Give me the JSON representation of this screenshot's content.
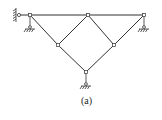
{
  "figure": {
    "caption": "(a)",
    "line_color": "#333333",
    "nodes": [
      {
        "id": "A",
        "x": 30,
        "y": 15
      },
      {
        "id": "B",
        "x": 88,
        "y": 15
      },
      {
        "id": "C",
        "x": 144,
        "y": 15
      },
      {
        "id": "D",
        "x": 58,
        "y": 45
      },
      {
        "id": "E",
        "x": 114,
        "y": 45
      },
      {
        "id": "F",
        "x": 86,
        "y": 72
      },
      {
        "id": "W",
        "x": 19,
        "y": 15
      }
    ],
    "members": [
      [
        "W",
        "A"
      ],
      [
        "A",
        "B"
      ],
      [
        "B",
        "C"
      ],
      [
        "A",
        "D"
      ],
      [
        "D",
        "B"
      ],
      [
        "B",
        "E"
      ],
      [
        "E",
        "C"
      ],
      [
        "D",
        "F"
      ],
      [
        "E",
        "F"
      ]
    ],
    "supports": [
      {
        "type": "wall",
        "at": "W"
      },
      {
        "type": "pin-ground",
        "at": "A"
      },
      {
        "type": "pin-ground",
        "at": "C"
      },
      {
        "type": "pin-ground",
        "at": "F"
      }
    ]
  }
}
